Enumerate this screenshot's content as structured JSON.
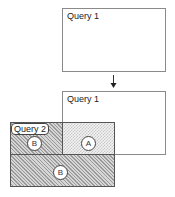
{
  "diagram": {
    "top_box": {
      "label": "Query 1"
    },
    "arrow": {
      "direction": "down"
    },
    "bottom_box": {
      "label": "Query 1"
    },
    "overlay": {
      "label": "Query 2",
      "regions": [
        {
          "id": "top-left",
          "circle_label": "B",
          "pattern": "diagonal-hatch"
        },
        {
          "id": "top-right",
          "circle_label": "A",
          "pattern": "crosshatch"
        },
        {
          "id": "bottom",
          "circle_label": "B",
          "pattern": "diagonal-hatch"
        }
      ]
    }
  }
}
